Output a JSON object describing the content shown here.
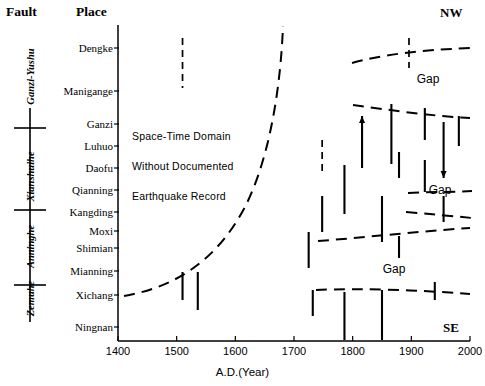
{
  "headers": {
    "fault": "Fault",
    "place": "Place"
  },
  "orientation": {
    "top": "NW",
    "bottom": "SE"
  },
  "faults": [
    {
      "name": "Ganzi-Yushu",
      "y": 78
    },
    {
      "name": "Xianshuihe",
      "y": 178
    },
    {
      "name": "Anninghe",
      "y": 248
    },
    {
      "name": "Zemuhe",
      "y": 300
    }
  ],
  "fault_separators_y": [
    128,
    210,
    285
  ],
  "fault_axis": {
    "x": 30,
    "top": 108,
    "bottom": 322
  },
  "annotation": {
    "domain_lines": [
      "Space-Time  Domain",
      "Without  Documented",
      "Earthquake  Record"
    ],
    "gap_labels": [
      "Gap",
      "Gap",
      "Gap"
    ]
  },
  "chart_data": {
    "type": "scatter",
    "title": "",
    "xlabel": "A.D.(Year)",
    "ylabel": "Place",
    "xlim": [
      1400,
      2000
    ],
    "xticks": [
      1400,
      1500,
      1600,
      1700,
      1800,
      1900,
      2000
    ],
    "xtick_labels": [
      "1400",
      "1500",
      "1600",
      "1700",
      "1800",
      "1900",
      "2000"
    ],
    "grid": false,
    "legend": null,
    "categories": [
      "Dengke",
      "Manigange",
      "Ganzi",
      "Luhuo",
      "Daofu",
      "Qianning",
      "Kangding",
      "Moxi",
      "Shimian",
      "Mianning",
      "Xichang",
      "Ningnan"
    ],
    "category_y": [
      48,
      91,
      124,
      146,
      168,
      190,
      212,
      231,
      248,
      271,
      295,
      327
    ],
    "ruptures": [
      {
        "place": "Dengke",
        "year": 1510,
        "y0": 38,
        "y1": 88,
        "style": "dashed",
        "arrow": "none"
      },
      {
        "place": "Mianning",
        "year": 1510,
        "y0": 272,
        "y1": 300,
        "style": "solid",
        "arrow": "none"
      },
      {
        "place": "Xichang",
        "year": 1536,
        "y0": 272,
        "y1": 310,
        "style": "solid",
        "arrow": "none"
      },
      {
        "place": "Shimian",
        "year": 1725,
        "y0": 232,
        "y1": 268,
        "style": "solid",
        "arrow": "none"
      },
      {
        "place": "Xichang",
        "year": 1732,
        "y0": 290,
        "y1": 316,
        "style": "solid",
        "arrow": "none"
      },
      {
        "place": "Daofu",
        "year": 1748,
        "y0": 140,
        "y1": 174,
        "style": "dashed",
        "arrow": "none"
      },
      {
        "place": "Kangding",
        "year": 1748,
        "y0": 196,
        "y1": 232,
        "style": "solid",
        "arrow": "none"
      },
      {
        "place": "Qianning",
        "year": 1786,
        "y0": 165,
        "y1": 214,
        "style": "solid",
        "arrow": "none"
      },
      {
        "place": "Ningnan",
        "year": 1786,
        "y0": 292,
        "y1": 340,
        "style": "solid",
        "arrow": "none"
      },
      {
        "place": "Luhuo",
        "year": 1816,
        "y0": 116,
        "y1": 168,
        "style": "solid",
        "arrow": "up"
      },
      {
        "place": "Moxi",
        "year": 1850,
        "y0": 196,
        "y1": 242,
        "style": "solid",
        "arrow": "none"
      },
      {
        "place": "Xichang",
        "year": 1850,
        "y0": 290,
        "y1": 340,
        "style": "solid",
        "arrow": "none"
      },
      {
        "place": "Manigange",
        "year": 1866,
        "y0": 104,
        "y1": 164,
        "style": "solid",
        "arrow": "none"
      },
      {
        "place": "Daofu",
        "year": 1879,
        "y0": 152,
        "y1": 178,
        "style": "solid",
        "arrow": "none"
      },
      {
        "place": "Shimian",
        "year": 1879,
        "y0": 236,
        "y1": 258,
        "style": "solid",
        "arrow": "none"
      },
      {
        "place": "Dengke",
        "year": 1896,
        "y0": 38,
        "y1": 68,
        "style": "dashed",
        "arrow": "none"
      },
      {
        "place": "Ganzi",
        "year": 1923,
        "y0": 108,
        "y1": 140,
        "style": "solid",
        "arrow": "none"
      },
      {
        "place": "Qianning",
        "year": 1923,
        "y0": 160,
        "y1": 192,
        "style": "solid",
        "arrow": "none"
      },
      {
        "place": "Xichang",
        "year": 1940,
        "y0": 282,
        "y1": 300,
        "style": "solid",
        "arrow": "none"
      },
      {
        "place": "Luhuo",
        "year": 1955,
        "y0": 122,
        "y1": 178,
        "style": "solid",
        "arrow": "down"
      },
      {
        "place": "Kangding",
        "year": 1955,
        "y0": 196,
        "y1": 222,
        "style": "solid",
        "arrow": "none"
      },
      {
        "place": "Ganzi",
        "year": 1981,
        "y0": 116,
        "y1": 146,
        "style": "solid",
        "arrow": "none"
      }
    ],
    "annotation_text": "Space-Time Domain Without Documented Earthquake Record"
  },
  "x_axis_pixels": {
    "left": 118,
    "right": 470,
    "baseline": 341,
    "top": 25
  }
}
